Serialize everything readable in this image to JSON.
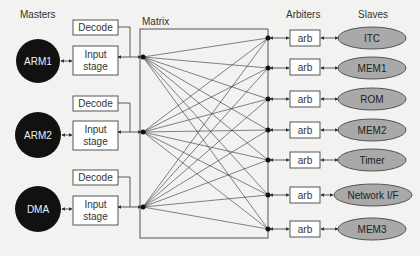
{
  "headers": {
    "masters": "Masters",
    "matrix": "Matrix",
    "arbiters": "Arbiters",
    "slaves": "Slaves"
  },
  "masters": [
    {
      "name": "ARM1",
      "decode": "Decode",
      "input_line1": "Input",
      "input_line2": "stage",
      "cy": 61
    },
    {
      "name": "ARM2",
      "decode": "Decode",
      "input_line1": "Input",
      "input_line2": "stage",
      "cy": 135
    },
    {
      "name": "DMA",
      "decode": "Decode",
      "input_line1": "Input",
      "input_line2": "stage",
      "cy": 209
    }
  ],
  "arbiters": [
    {
      "label": "arb"
    },
    {
      "label": "arb"
    },
    {
      "label": "arb"
    },
    {
      "label": "arb"
    },
    {
      "label": "arb"
    },
    {
      "label": "arb"
    },
    {
      "label": "arb"
    }
  ],
  "slaves": [
    {
      "name": "ITC",
      "cy": 38
    },
    {
      "name": "MEM1",
      "cy": 68
    },
    {
      "name": "ROM",
      "cy": 99
    },
    {
      "name": "MEM2",
      "cy": 130
    },
    {
      "name": "Timer",
      "cy": 160
    },
    {
      "name": "Network I/F",
      "cy": 195
    },
    {
      "name": "MEM3",
      "cy": 229
    }
  ],
  "colors": {
    "master_fill": "#111111",
    "slave_fill": "#a9a9a9",
    "box_fill": "#ffffff",
    "line": "#333333",
    "background": "#f2f2f0"
  }
}
